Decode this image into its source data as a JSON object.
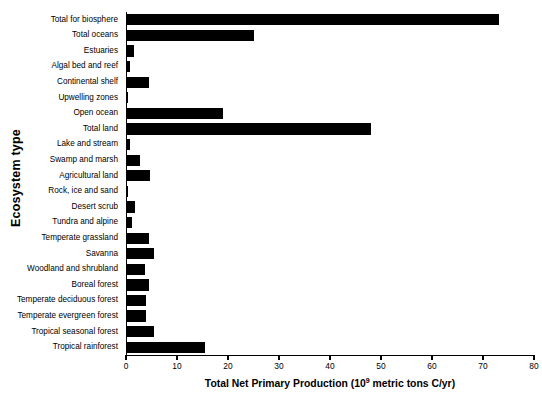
{
  "chart_data": {
    "type": "bar",
    "orientation": "horizontal",
    "title": "",
    "xlabel_parts": {
      "before": "Total Net Primary Production (10",
      "exponent": "9",
      "after": " metric tons C/yr)"
    },
    "xlabel": "Total Net Primary Production (10^9 metric tons C/yr)",
    "ylabel": "Ecosystem type",
    "xlim": [
      0,
      80
    ],
    "xticks": [
      0,
      10,
      20,
      30,
      40,
      50,
      60,
      70,
      80
    ],
    "xtick_labels": [
      "0",
      "10",
      "20",
      "30",
      "40",
      "50",
      "60",
      "70",
      "80"
    ],
    "grid": false,
    "legend": false,
    "bar_color": "#000000",
    "categories": [
      "Total for biosphere",
      "Total oceans",
      "Estuaries",
      "Algal bed and reef",
      "Continental shelf",
      "Upwelling zones",
      "Open ocean",
      "Total land",
      "Lake and stream",
      "Swamp and marsh",
      "Agricultural land",
      "Rock, ice and sand",
      "Desert scrub",
      "Tundra and alpine",
      "Temperate grassland",
      "Savanna",
      "Woodland and shrubland",
      "Boreal forest",
      "Temperate deciduous forest",
      "Temperate evergreen forest",
      "Tropical seasonal forest",
      "Tropical rainforest"
    ],
    "values": [
      73.0,
      24.9,
      1.4,
      0.5,
      4.3,
      0.1,
      18.9,
      47.9,
      0.5,
      2.5,
      4.5,
      0.1,
      1.5,
      1.0,
      4.4,
      5.3,
      3.5,
      4.3,
      3.8,
      3.7,
      5.3,
      15.2
    ]
  }
}
